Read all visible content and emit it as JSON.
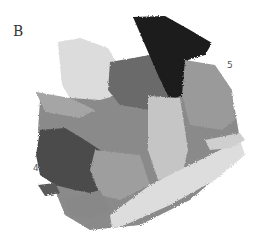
{
  "figure": {
    "panel_label": "B",
    "markers": [
      {
        "label": "5"
      },
      {
        "label": "4"
      }
    ],
    "palette": {
      "black": "#1a1a1a",
      "dark": "#4a4a4a",
      "mid_dark": "#6e6e6e",
      "mid": "#8c8c8c",
      "light": "#b5b5b5",
      "lighter": "#cfcfcf",
      "lightest": "#e2e2e2"
    }
  }
}
